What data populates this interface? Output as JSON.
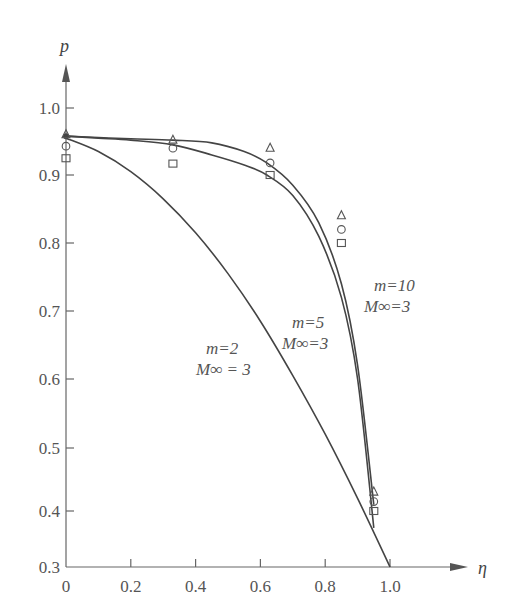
{
  "chart_data": {
    "type": "line",
    "title": "",
    "xlabel": "η",
    "ylabel": "p",
    "xlim": [
      0,
      1.15
    ],
    "ylim": [
      0.3,
      1.05
    ],
    "grid": false,
    "x_ticks": [
      "0",
      "0.2",
      "0.4",
      "0.6",
      "0.8",
      "1.0"
    ],
    "y_ticks": [
      "0.3",
      "0.4",
      "0.5",
      "0.6",
      "0.7",
      "0.8",
      "0.9",
      "1.0"
    ],
    "series": [
      {
        "name": "m=2, M∞=3",
        "label_line1": "m=2",
        "label_line2": "M∞ = 3",
        "x": [
          0,
          0.1,
          0.2,
          0.3,
          0.4,
          0.5,
          0.6,
          0.7,
          0.8,
          0.9,
          1.0
        ],
        "values": [
          0.955,
          0.935,
          0.905,
          0.865,
          0.815,
          0.755,
          0.685,
          0.605,
          0.52,
          0.42,
          0.3
        ]
      },
      {
        "name": "m=5, M∞=3",
        "label_line1": "m=5",
        "label_line2": "M∞=3",
        "x": [
          0,
          0.1,
          0.2,
          0.33,
          0.45,
          0.55,
          0.62,
          0.7,
          0.78,
          0.85,
          0.9,
          0.95
        ],
        "values": [
          0.958,
          0.955,
          0.952,
          0.945,
          0.93,
          0.915,
          0.9,
          0.87,
          0.81,
          0.72,
          0.6,
          0.37
        ]
      },
      {
        "name": "m=10, M∞=3",
        "label_line1": "m=10",
        "label_line2": "M∞=3",
        "x": [
          0,
          0.1,
          0.2,
          0.33,
          0.45,
          0.55,
          0.62,
          0.7,
          0.78,
          0.85,
          0.9,
          0.95
        ],
        "values": [
          0.958,
          0.956,
          0.954,
          0.952,
          0.948,
          0.935,
          0.918,
          0.885,
          0.83,
          0.74,
          0.62,
          0.41
        ]
      }
    ],
    "markers": [
      {
        "shape": "triangle",
        "points": [
          [
            0,
            0.96
          ],
          [
            0.33,
            0.952
          ],
          [
            0.63,
            0.94
          ],
          [
            0.85,
            0.84
          ],
          [
            0.95,
            0.43
          ]
        ]
      },
      {
        "shape": "circle",
        "points": [
          [
            0,
            0.943
          ],
          [
            0.33,
            0.94
          ],
          [
            0.63,
            0.918
          ],
          [
            0.85,
            0.82
          ],
          [
            0.95,
            0.415
          ]
        ]
      },
      {
        "shape": "square",
        "points": [
          [
            0,
            0.925
          ],
          [
            0.33,
            0.917
          ],
          [
            0.63,
            0.9
          ],
          [
            0.85,
            0.8
          ],
          [
            0.95,
            0.4
          ]
        ]
      }
    ]
  }
}
